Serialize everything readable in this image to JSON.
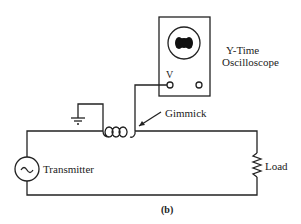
{
  "diagram": {
    "caption": "(b)",
    "components": {
      "oscilloscope": {
        "label_line1": "Y-Time",
        "label_line2": "Oscilloscope",
        "terminal_label": "V"
      },
      "gimmick": {
        "label": "Gimmick"
      },
      "transmitter": {
        "label": "Transmitter"
      },
      "load": {
        "label": "Load"
      }
    },
    "colors": {
      "line": "#222222",
      "background": "#ffffff"
    }
  }
}
